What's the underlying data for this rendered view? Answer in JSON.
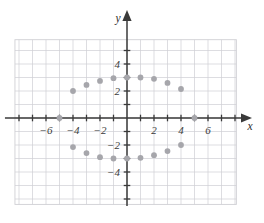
{
  "figure": {
    "title": "",
    "background_color": "#ffffff"
  },
  "chart_data": {
    "type": "scatter",
    "title": "",
    "xlabel": "x",
    "ylabel": "y",
    "xlim": [
      -8.3,
      8.1
    ],
    "ylim": [
      -6.4,
      5.8
    ],
    "grid": true,
    "grid_color": "#cfcfd4",
    "grid_step": 1,
    "axis_color": "#3a3a3a",
    "point_color": "#a6a6ab",
    "point_radius": 2.9,
    "legend": "none",
    "xticks": [
      -6,
      -4,
      -2,
      2,
      4,
      6
    ],
    "xtick_labels": [
      "−6",
      "−4",
      "−2",
      "2",
      "4",
      "6"
    ],
    "yticks": [
      4,
      2,
      -2,
      -4
    ],
    "ytick_labels": [
      "4",
      "2",
      "−2",
      "−4"
    ],
    "points": [
      {
        "x": -5,
        "y": 0
      },
      {
        "x": -4,
        "y": 2
      },
      {
        "x": -3,
        "y": 2.45
      },
      {
        "x": -2,
        "y": 2.75
      },
      {
        "x": -1,
        "y": 2.95
      },
      {
        "x": 0,
        "y": 3
      },
      {
        "x": 1,
        "y": 3
      },
      {
        "x": 2,
        "y": 2.9
      },
      {
        "x": 3,
        "y": 2.6
      },
      {
        "x": 4,
        "y": 2.15
      },
      {
        "x": -4,
        "y": -2.15
      },
      {
        "x": -3,
        "y": -2.6
      },
      {
        "x": -2,
        "y": -2.9
      },
      {
        "x": -1,
        "y": -3
      },
      {
        "x": 0,
        "y": -3
      },
      {
        "x": 1,
        "y": -2.95
      },
      {
        "x": 2,
        "y": -2.75
      },
      {
        "x": 3,
        "y": -2.45
      },
      {
        "x": 4,
        "y": -2
      },
      {
        "x": 5,
        "y": 0
      }
    ]
  }
}
